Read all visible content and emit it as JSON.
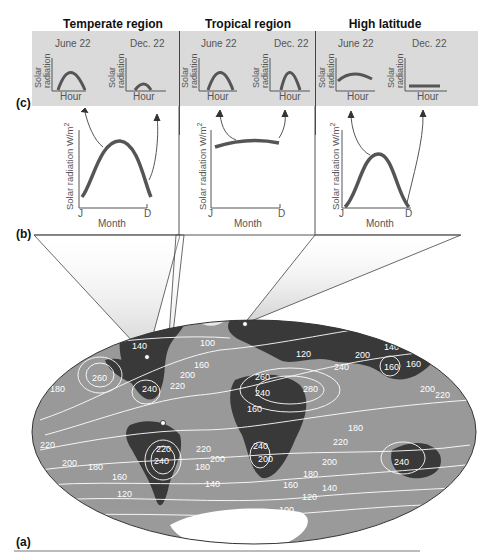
{
  "figure": {
    "panel_labels": {
      "a": "(a)",
      "b": "(b)",
      "c": "(c)"
    },
    "regions": [
      {
        "title": "Temperate region",
        "daily": [
          {
            "date": "June 22",
            "ylabel_line1": "Solar",
            "ylabel_line2": "radiation",
            "xlabel": "Hour",
            "curve": "high-arch"
          },
          {
            "date": "Dec. 22",
            "ylabel_line1": "Solar",
            "ylabel_line2": "radiation",
            "xlabel": "Hour",
            "curve": "low-small-arch"
          }
        ],
        "annual": {
          "ylabel": "Solar radiation W/m",
          "ylabel_sup": "2",
          "x_start": "J",
          "x_end": "D",
          "xlabel": "Month",
          "curve": "broad-peak-mid-year"
        }
      },
      {
        "title": "Tropical region",
        "daily": [
          {
            "date": "June 22",
            "ylabel_line1": "Solar",
            "ylabel_line2": "radiation",
            "xlabel": "Hour",
            "curve": "high-arch"
          },
          {
            "date": "Dec. 22",
            "ylabel_line1": "Solar",
            "ylabel_line2": "radiation",
            "xlabel": "Hour",
            "curve": "high-arch"
          }
        ],
        "annual": {
          "ylabel": "Solar radiation W/m",
          "ylabel_sup": "2",
          "x_start": "J",
          "x_end": "D",
          "xlabel": "Month",
          "curve": "flat-high"
        }
      },
      {
        "title": "High latitude",
        "daily": [
          {
            "date": "June 22",
            "ylabel_line1": "Solar",
            "ylabel_line2": "radiation",
            "xlabel": "Hour",
            "curve": "long-low-arch"
          },
          {
            "date": "Dec. 22",
            "ylabel_line1": "Solar",
            "ylabel_line2": "radiation",
            "xlabel": "Hour",
            "curve": "flat-near-zero"
          }
        ],
        "annual": {
          "ylabel": "Solar radiation W/m",
          "ylabel_sup": "2",
          "x_start": "J",
          "x_end": "D",
          "xlabel": "Month",
          "curve": "sharp-peak-mid-year"
        }
      }
    ],
    "map": {
      "description": "World map of annual mean solar radiation contours (W/m2)",
      "contour_labels": [
        "80",
        "120",
        "140",
        "100",
        "160",
        "200",
        "220",
        "240",
        "260",
        "180",
        "260",
        "240",
        "280",
        "180",
        "200",
        "240",
        "160",
        "140",
        "120",
        "100",
        "220",
        "240",
        "220",
        "200",
        "180",
        "160",
        "140",
        "120",
        "240",
        "200",
        "220",
        "180",
        "200",
        "180",
        "160",
        "140",
        "120",
        "100",
        "140",
        "160",
        "200",
        "220",
        "240"
      ],
      "colors": {
        "ocean": "#9a9a9a",
        "land": "#3a3a3a",
        "ice": "#ffffff",
        "contour": "#ffffff"
      }
    }
  }
}
